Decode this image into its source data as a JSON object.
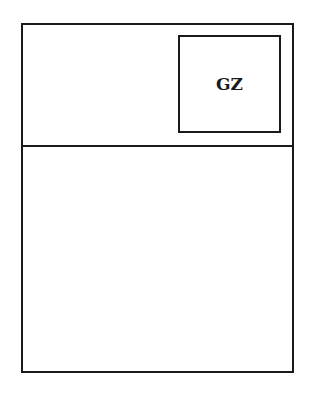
{
  "diagram": {
    "outer_frame": {
      "stroke": "#1a1a1a"
    },
    "inner_box": {
      "label": "GZ"
    }
  }
}
